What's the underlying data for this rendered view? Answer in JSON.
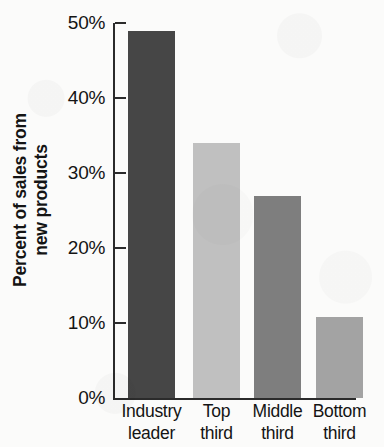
{
  "chart_data": {
    "type": "bar",
    "title": "",
    "xlabel": "",
    "ylabel": "Percent of sales from new products",
    "categories": [
      "Industry leader",
      "Top third",
      "Middle third",
      "Bottom third"
    ],
    "category_lines": [
      [
        "Industry",
        "leader"
      ],
      [
        "Top",
        "third"
      ],
      [
        "Middle",
        "third"
      ],
      [
        "Bottom",
        "third"
      ]
    ],
    "values": [
      49,
      34,
      27,
      10.8
    ],
    "value_labels": [
      "49%",
      "34%",
      "27%",
      "10.8%"
    ],
    "ylim": [
      0,
      50
    ],
    "ytick_values": [
      0,
      10,
      20,
      30,
      40,
      50
    ],
    "ytick_labels": [
      "0%",
      "10%",
      "20%",
      "30%",
      "40%",
      "50%"
    ],
    "grid": false,
    "legend": null,
    "bar_colors": [
      "#464646",
      "#c0c0c0",
      "#7e7e7e",
      "#a3a3a3"
    ],
    "axis_color": "#2b2b2b",
    "background_color": "#fbfbfa"
  }
}
